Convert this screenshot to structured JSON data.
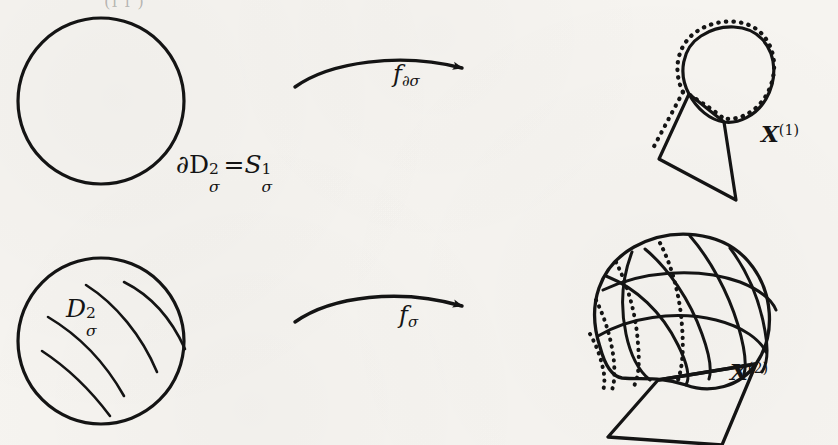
{
  "figure": {
    "kind": "math-diagram",
    "background_color": "#f6f4f0",
    "ink_color": "#141414",
    "width": 838,
    "height": 445
  },
  "bleed_through": {
    "top_fragment": "(i i )"
  },
  "rows": [
    {
      "id": "row-boundary",
      "source_label": "∂D²σ = S¹σ",
      "arrow_label": "f∂σ",
      "target_label": "X(1)"
    },
    {
      "id": "row-disk",
      "source_label": "D²σ",
      "arrow_label": "fσ",
      "target_label": "X(2)"
    }
  ],
  "labels": {
    "boundary_disk": {
      "base": "∂D",
      "sup": "2",
      "sub": "σ",
      "equals": "=",
      "base2": "S",
      "sup2": "1",
      "sub2": "σ"
    },
    "disk": {
      "base": "D",
      "sup": "2",
      "sub": "σ"
    },
    "arrow_top": {
      "base": "f",
      "sub": "∂σ"
    },
    "arrow_bottom": {
      "base": "f",
      "sub": "σ"
    },
    "x1": {
      "base": "X",
      "sup": "(1)"
    },
    "x2": {
      "base": "X",
      "sup": "(2)"
    }
  },
  "shapes": {
    "boundary_circle": {
      "name": "circle-1-sphere",
      "cx": 101,
      "cy": 101,
      "r": 83,
      "filled": false,
      "hatch_count": 0
    },
    "disk_circle": {
      "name": "circle-2-disk",
      "cx": 101,
      "cy": 341,
      "r": 83,
      "filled": false,
      "hatch_count": 5
    },
    "one_skeleton": {
      "name": "loop-with-quadrilateral",
      "has_dotted_overlay": true,
      "loop": "teardrop",
      "base_polygon": "quadrilateral"
    },
    "two_skeleton": {
      "name": "dome-with-quadrilateral",
      "has_dotted_overlay": true,
      "meridian_count": 5,
      "dotted_curve_count": 4,
      "base_polygon": "quadrilateral"
    },
    "arrow_top": {
      "name": "curved-arrow",
      "x_start": 295,
      "x_end": 466,
      "y": 72
    },
    "arrow_bottom": {
      "name": "curved-arrow",
      "x_start": 295,
      "x_end": 466,
      "y": 310
    }
  }
}
